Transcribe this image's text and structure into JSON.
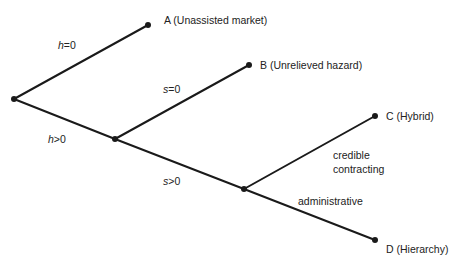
{
  "diagram": {
    "type": "decision-tree",
    "nodes": [
      {
        "id": "root",
        "x": 14,
        "y": 99
      },
      {
        "id": "A",
        "x": 148,
        "y": 25,
        "label": "A (Unassisted market)"
      },
      {
        "id": "n2",
        "x": 115,
        "y": 139
      },
      {
        "id": "B",
        "x": 249,
        "y": 65,
        "label": "B (Unrelieved hazard)"
      },
      {
        "id": "n3",
        "x": 244,
        "y": 189
      },
      {
        "id": "C",
        "x": 375,
        "y": 116,
        "label": "C (Hybrid)"
      },
      {
        "id": "D",
        "x": 375,
        "y": 240,
        "label": "D (Hierarchy)"
      }
    ],
    "edges": [
      {
        "from": "root",
        "to": "A",
        "var": "h",
        "cond": "=0"
      },
      {
        "from": "root",
        "to": "n2",
        "var": "h",
        "cond": ">0"
      },
      {
        "from": "n2",
        "to": "B",
        "var": "s",
        "cond": "=0"
      },
      {
        "from": "n2",
        "to": "n3",
        "var": "s",
        "cond": ">0"
      },
      {
        "from": "n3",
        "to": "C",
        "label_line1": "credible",
        "label_line2": "contracting"
      },
      {
        "from": "n3",
        "to": "D",
        "label": "administrative"
      }
    ]
  },
  "labels": {
    "A": "A (Unassisted market)",
    "B": "B (Unrelieved hazard)",
    "C": "C (Hybrid)",
    "D": "D (Hierarchy)",
    "h_var": "h",
    "h_eq": "=0",
    "h_gt": ">0",
    "s_var": "s",
    "s_eq": "=0",
    "s_gt": ">0",
    "credible": "credible",
    "contracting": "contracting",
    "administrative": "administrative"
  },
  "colors": {
    "line": "#1a1a1a",
    "text": "#222222",
    "background": "#ffffff"
  }
}
